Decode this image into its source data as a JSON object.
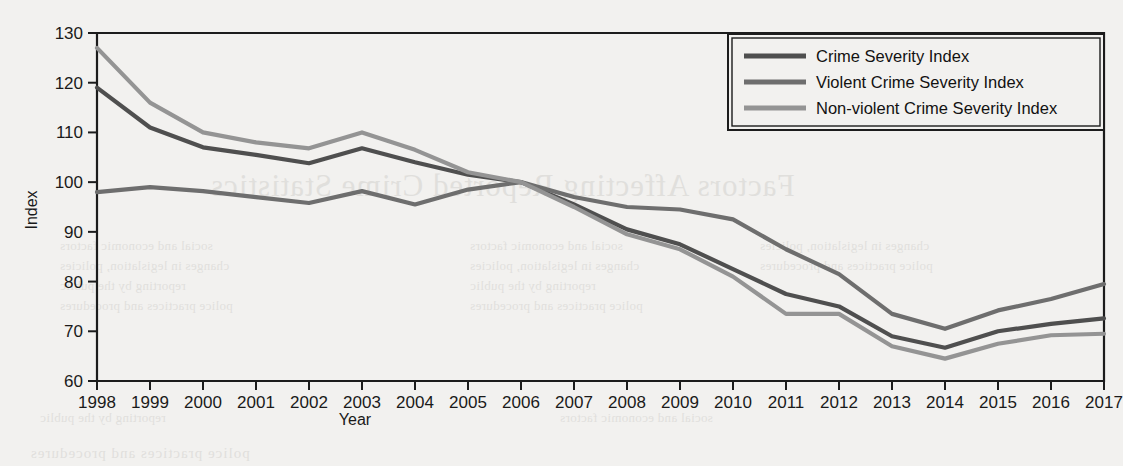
{
  "chart_data": {
    "type": "line",
    "title": "",
    "xlabel": "Year",
    "ylabel": "Index",
    "xlim": [
      1998,
      2017
    ],
    "ylim": [
      60,
      130
    ],
    "yticks": [
      60,
      70,
      80,
      90,
      100,
      110,
      120,
      130
    ],
    "grid": false,
    "legend_position": "top-right",
    "categories": [
      "1998",
      "1999",
      "2000",
      "2001",
      "2002",
      "2003",
      "2004",
      "2005",
      "2006",
      "2007",
      "2008",
      "2009",
      "2010",
      "2011",
      "2012",
      "2013",
      "2014",
      "2015",
      "2016",
      "2017"
    ],
    "series": [
      {
        "name": "Crime Severity Index",
        "color": "#4f4f4f",
        "values": [
          119.0,
          111.0,
          107.0,
          105.5,
          103.8,
          106.8,
          104.0,
          101.5,
          100.0,
          95.5,
          90.5,
          87.5,
          82.5,
          77.5,
          75.0,
          69.0,
          66.7,
          70.0,
          71.5,
          72.6
        ]
      },
      {
        "name": "Violent Crime Severity Index",
        "color": "#6e6e6e",
        "values": [
          98.0,
          99.0,
          98.2,
          97.0,
          95.8,
          98.2,
          95.5,
          98.5,
          100.0,
          97.0,
          95.0,
          94.5,
          92.5,
          86.5,
          81.5,
          73.5,
          70.5,
          74.2,
          76.5,
          79.5
        ]
      },
      {
        "name": "Non-violent Crime Severity Index",
        "color": "#949494",
        "values": [
          127.0,
          116.0,
          110.0,
          108.0,
          106.8,
          110.0,
          106.5,
          102.0,
          100.0,
          95.0,
          89.5,
          86.5,
          81.0,
          73.5,
          73.5,
          67.0,
          64.5,
          67.5,
          69.2,
          69.5
        ]
      }
    ]
  },
  "axes": {
    "y_label": "Index",
    "x_label": "Year",
    "y_tick_labels": [
      "130",
      "120",
      "110",
      "100",
      "90",
      "80",
      "70",
      "60"
    ],
    "x_tick_labels": [
      "1998",
      "1999",
      "2000",
      "2001",
      "2002",
      "2003",
      "2004",
      "2005",
      "2006",
      "2007",
      "2008",
      "2009",
      "2010",
      "2011",
      "2012",
      "2013",
      "2014",
      "2015",
      "2016",
      "2017"
    ]
  },
  "legend": {
    "items": [
      {
        "label": "Crime Severity Index",
        "color": "#4f4f4f"
      },
      {
        "label": "Violent Crime Severity Index",
        "color": "#6e6e6e"
      },
      {
        "label": "Non-violent Crime Severity Index",
        "color": "#949494"
      }
    ]
  },
  "background_bleed": {
    "heading": "Factors Affecting Reported Crime Statistics",
    "lines": [
      "social and economic factors",
      "changes in legislation, policies",
      "reporting by the public",
      "police practices and procedures"
    ]
  }
}
